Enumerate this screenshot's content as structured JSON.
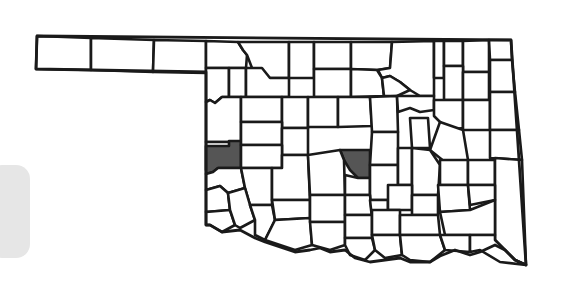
{
  "map": {
    "title": "Oklahoma counties",
    "region": "Oklahoma",
    "highlighted_counties": [
      "Custer",
      "Oklahoma"
    ],
    "colors": {
      "highlight_fill": "#555555",
      "county_fill": "#ffffff",
      "border": "#1a1a1a",
      "side_tab": "#e6e6e6"
    }
  }
}
